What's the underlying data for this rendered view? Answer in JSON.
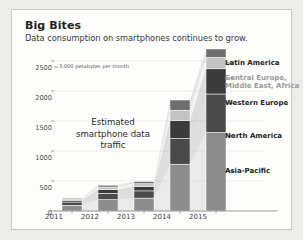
{
  "header": {
    "title": "Big Bites",
    "subtitle": "Data consumption on smartphones continues to grow."
  },
  "annotations": {
    "unit_note": "3,000 petabytes per month",
    "callout_line1": "Estimated",
    "callout_line2": "smartphone data",
    "callout_line3": "traffic"
  },
  "colors": {
    "asia_pacific": "#8c8c8c",
    "north_america": "#4a4a4a",
    "western_europe": "#3b3b3b",
    "cemea": "#c3c3c3",
    "latin_america": "#6e6e6e",
    "card_bg": "#fdfdfc",
    "page_bg": "#ececeb",
    "axis": "#8d8d8d",
    "grid": "#e4e4e2"
  },
  "chart_data": {
    "type": "bar",
    "title": "Big Bites",
    "subtitle": "Data consumption on smartphones continues to grow.",
    "stacked": true,
    "xlabel": "",
    "ylabel": "petabytes per month",
    "ylim": [
      0,
      3000
    ],
    "yticks": [
      0,
      500,
      1000,
      1500,
      2000,
      2500
    ],
    "ytick_labels": [
      "0",
      "500",
      "1000",
      "1500",
      "2000",
      "2500"
    ],
    "grid": true,
    "legend_position": "right",
    "categories": [
      "2011",
      "2012",
      "2013",
      "2014",
      "2015"
    ],
    "series": [
      {
        "name": "Asia-Pacific",
        "values": [
          95,
          190,
          215,
          780,
          1310
        ]
      },
      {
        "name": "North America",
        "values": [
          55,
          105,
          120,
          430,
          640
        ]
      },
      {
        "name": "Western Europe",
        "values": [
          30,
          65,
          75,
          300,
          420
        ]
      },
      {
        "name": "Central Europe, Middle East, Africa",
        "values": [
          20,
          40,
          45,
          170,
          190
        ]
      },
      {
        "name": "Latin America",
        "values": [
          15,
          30,
          35,
          170,
          140
        ]
      }
    ],
    "totals": [
      215,
      430,
      490,
      1850,
      2700
    ],
    "legend": [
      {
        "label": "Latin America",
        "color": "#6e6e6e",
        "muted": false
      },
      {
        "label": "Central Europe,",
        "color": "#c3c3c3",
        "muted": true
      },
      {
        "label": "Middle East, Africa",
        "color": "#c3c3c3",
        "muted": true
      },
      {
        "label": "Western Europe",
        "color": "#3b3b3b",
        "muted": false
      },
      {
        "label": "North America",
        "color": "#4a4a4a",
        "muted": false
      },
      {
        "label": "Asia-Pacific",
        "color": "#8c8c8c",
        "muted": false
      }
    ]
  }
}
